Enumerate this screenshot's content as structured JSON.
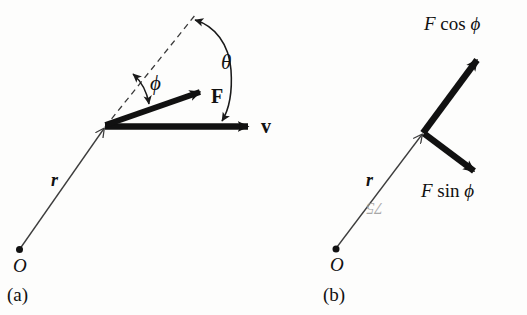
{
  "figure": {
    "kind": "physics-vector-diagram",
    "background_color": "#fdfdfc",
    "ink_color": "#111111",
    "thin_line_color": "#4a4a4a"
  },
  "panels": [
    {
      "id": "a",
      "caption": "(a)",
      "origin_label": "O",
      "radius_label": "r",
      "force_label": "F",
      "velocity_label": "v",
      "angle_theta_label": "θ",
      "angle_phi_label": "ϕ",
      "angles": {
        "theta_between": "dashed extension of r and v",
        "phi_between": "dashed extension of r and F"
      }
    },
    {
      "id": "b",
      "caption": "(b)",
      "origin_label": "O",
      "radius_label": "r",
      "component_parallel": {
        "prefix": "F",
        "func": "cos",
        "symbol": "ϕ"
      },
      "component_perpendicular": {
        "prefix": "F",
        "func": "sin",
        "symbol": "ϕ"
      }
    }
  ],
  "artifacts": {
    "bleed_through_page_number": "75"
  }
}
